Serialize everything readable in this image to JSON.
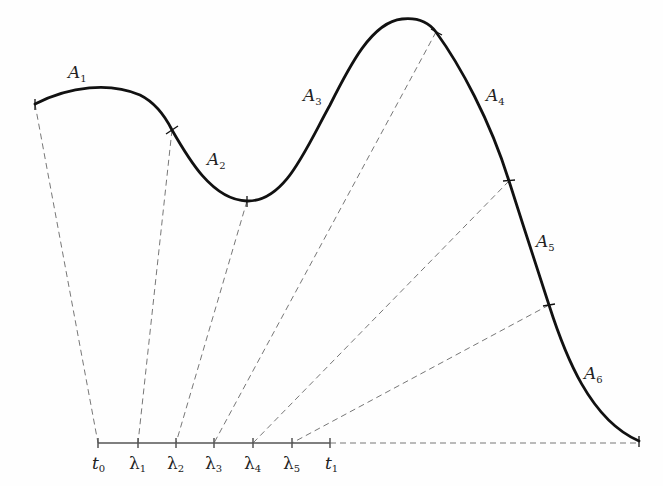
{
  "diagram": {
    "arc_labels": [
      {
        "id": "A1",
        "base": "A",
        "sub": "1",
        "x": 68,
        "y": 78
      },
      {
        "id": "A2",
        "base": "A",
        "sub": "2",
        "x": 207,
        "y": 165
      },
      {
        "id": "A3",
        "base": "A",
        "sub": "3",
        "x": 303,
        "y": 101
      },
      {
        "id": "A4",
        "base": "A",
        "sub": "4",
        "x": 486,
        "y": 101
      },
      {
        "id": "A5",
        "base": "A",
        "sub": "5",
        "x": 536,
        "y": 247
      },
      {
        "id": "A6",
        "base": "A",
        "sub": "6",
        "x": 584,
        "y": 379
      }
    ],
    "interval_labels": [
      {
        "base": "t",
        "sub": "0",
        "x": 92,
        "italic": true
      },
      {
        "base": "λ",
        "sub": "1",
        "x": 129,
        "italic": false
      },
      {
        "base": "λ",
        "sub": "2",
        "x": 167,
        "italic": false
      },
      {
        "base": "λ",
        "sub": "3",
        "x": 205,
        "italic": false
      },
      {
        "base": "λ",
        "sub": "4",
        "x": 244,
        "italic": false
      },
      {
        "base": "λ",
        "sub": "5",
        "x": 283,
        "italic": false
      },
      {
        "base": "t",
        "sub": "1",
        "x": 325,
        "italic": true
      }
    ],
    "axis": {
      "y": 443,
      "ticks": [
        98,
        138,
        176,
        214,
        253,
        292,
        330
      ]
    },
    "curve_points": [
      [
        35,
        104
      ],
      [
        172,
        130
      ],
      [
        247,
        201
      ],
      [
        436,
        32
      ],
      [
        509,
        181
      ],
      [
        549,
        305
      ],
      [
        639,
        441
      ]
    ],
    "colors": {
      "curve": "#111111",
      "dash": "#777777",
      "axis": "#555555"
    }
  }
}
